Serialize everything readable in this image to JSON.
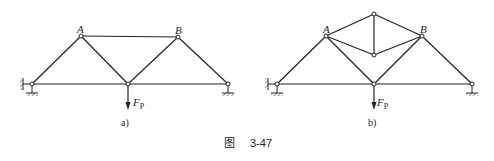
{
  "figure": {
    "caption_prefix": "图",
    "caption_number": "3-47",
    "panels": [
      {
        "id": "a",
        "label": "a)",
        "node_labels": {
          "A": "A",
          "B": "B"
        },
        "load_label": "F",
        "load_subscript": "P"
      },
      {
        "id": "b",
        "label": "b)",
        "node_labels": {
          "A": "A",
          "B": "B"
        },
        "load_label": "F",
        "load_subscript": "P"
      }
    ]
  }
}
